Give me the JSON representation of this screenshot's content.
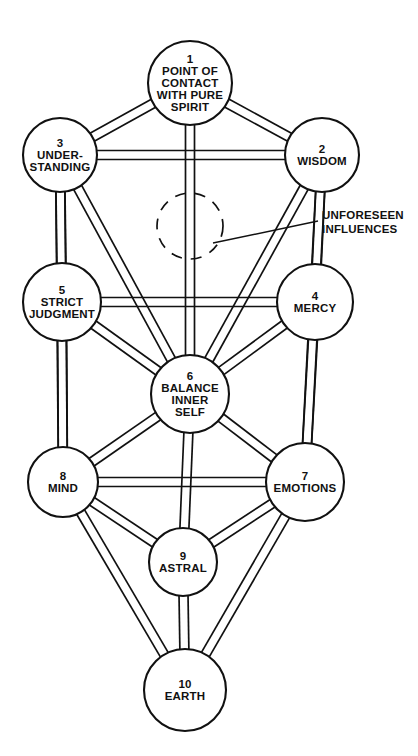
{
  "diagram": {
    "background_color": "#ffffff",
    "ink_color": "#111111",
    "nodes": [
      {
        "id": 1,
        "number": "1",
        "cx": 190,
        "cy": 83,
        "r": 42,
        "lines": [
          "POINT OF",
          "CONTACT",
          "WITH PURE",
          "SPIRIT"
        ]
      },
      {
        "id": 2,
        "number": "2",
        "cx": 322,
        "cy": 155,
        "r": 37,
        "lines": [
          "WISDOM"
        ]
      },
      {
        "id": 3,
        "number": "3",
        "cx": 60,
        "cy": 155,
        "r": 37,
        "lines": [
          "UNDER-",
          "STANDING"
        ]
      },
      {
        "id": 4,
        "number": "4",
        "cx": 315,
        "cy": 302,
        "r": 38,
        "lines": [
          "MERCY"
        ]
      },
      {
        "id": 5,
        "number": "5",
        "cx": 62,
        "cy": 302,
        "r": 39,
        "lines": [
          "STRICT",
          "JUDGMENT"
        ]
      },
      {
        "id": 6,
        "number": "6",
        "cx": 190,
        "cy": 394,
        "r": 39,
        "lines": [
          "BALANCE",
          "INNER",
          "SELF"
        ]
      },
      {
        "id": 7,
        "number": "7",
        "cx": 305,
        "cy": 482,
        "r": 39,
        "lines": [
          "EMOTIONS"
        ]
      },
      {
        "id": 8,
        "number": "8",
        "cx": 63,
        "cy": 482,
        "r": 35,
        "lines": [
          "MIND"
        ]
      },
      {
        "id": 9,
        "number": "9",
        "cx": 183,
        "cy": 562,
        "r": 34,
        "lines": [
          "ASTRAL"
        ]
      },
      {
        "id": 10,
        "number": "10",
        "cx": 185,
        "cy": 690,
        "r": 41,
        "lines": [
          "EARTH"
        ]
      }
    ],
    "paths": [
      [
        1,
        2
      ],
      [
        1,
        3
      ],
      [
        1,
        6
      ],
      [
        2,
        3
      ],
      [
        2,
        4
      ],
      [
        2,
        6
      ],
      [
        2,
        7
      ],
      [
        3,
        5
      ],
      [
        3,
        6
      ],
      [
        3,
        8
      ],
      [
        4,
        5
      ],
      [
        4,
        6
      ],
      [
        4,
        7
      ],
      [
        5,
        6
      ],
      [
        5,
        8
      ],
      [
        6,
        7
      ],
      [
        6,
        8
      ],
      [
        6,
        9
      ],
      [
        7,
        8
      ],
      [
        7,
        9
      ],
      [
        7,
        10
      ],
      [
        8,
        9
      ],
      [
        8,
        10
      ],
      [
        9,
        10
      ]
    ],
    "path_gap": 9,
    "unforeseen": {
      "circle": {
        "cx": 190,
        "cy": 226,
        "r": 33
      },
      "leader": {
        "x1": 213,
        "y1": 243,
        "x2": 318,
        "y2": 221
      },
      "label_lines": [
        "UNFORESEEN",
        "INFLUENCES"
      ],
      "label_x": 322,
      "label_y": 219
    }
  }
}
